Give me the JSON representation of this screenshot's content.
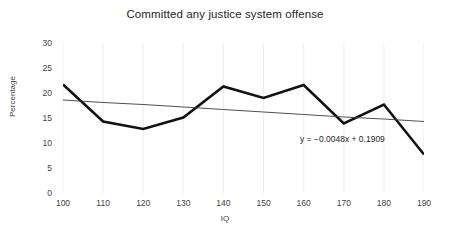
{
  "chart_data": {
    "type": "line",
    "title": "Committed any justice system offense",
    "xlabel": "IQ",
    "ylabel": "Percentage",
    "x": [
      100,
      110,
      120,
      130,
      140,
      150,
      160,
      170,
      180,
      190
    ],
    "xlim": [
      100,
      190
    ],
    "ylim": [
      0,
      30
    ],
    "xticks": [
      "100",
      "110",
      "120",
      "130",
      "140",
      "150",
      "160",
      "170",
      "180",
      "190"
    ],
    "yticks": [
      "30",
      "25",
      "20",
      "15",
      "10",
      "5",
      "0"
    ],
    "grid": "vertical-only",
    "legend": "none",
    "series": [
      {
        "name": "Committed any justice system offense",
        "type": "line",
        "color": "#121212",
        "width": 2.6,
        "values": [
          21.7,
          14.3,
          12.8,
          15.1,
          21.3,
          19.0,
          21.6,
          13.9,
          17.7,
          7.7
        ]
      },
      {
        "name": "Linear trendline",
        "type": "line",
        "color": "#3c3c3c",
        "width": 0.9,
        "values": [
          18.6,
          18.1,
          17.7,
          17.2,
          16.7,
          16.2,
          15.7,
          15.2,
          14.8,
          14.3
        ]
      }
    ],
    "annotations": [
      {
        "name": "trendline-equation",
        "text": "y = −0.0048x + 0.1909",
        "x": 172,
        "y": 11
      }
    ]
  },
  "colors": {
    "background": "#ffffff",
    "data_line": "#121212",
    "trend_line": "#3c3c3c",
    "gridline": "#ededed",
    "text": "#3f3f3f",
    "title_text": "#262626"
  }
}
